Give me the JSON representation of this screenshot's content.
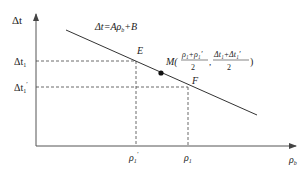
{
  "diagram": {
    "type": "line-graph",
    "axes": {
      "y_label": "Δt",
      "x_label": "ρ",
      "x_label_sub": "b"
    },
    "equation": {
      "text": "Δt=Aρ",
      "sub": "b",
      "suffix": "+B"
    },
    "points": {
      "E": {
        "label": "E"
      },
      "F": {
        "label": "F"
      },
      "M": {
        "label": "M(",
        "x_numerator": "ρ₁+ρ₁′",
        "x_denominator": "2",
        "separator": ",",
        "y_numerator": "Δt₁+Δt₁′",
        "y_denominator": "2",
        "close": ")"
      }
    },
    "ticks": {
      "y": [
        {
          "label": "Δt",
          "sub": "1",
          "prime": ""
        },
        {
          "label": "Δt",
          "sub": "1",
          "prime": "′"
        }
      ],
      "x": [
        {
          "label": "ρ",
          "sub": "1",
          "prime": "′"
        },
        {
          "label": "ρ",
          "sub": "1",
          "prime": ""
        }
      ]
    },
    "colors": {
      "line": "#333333",
      "axis": "#555555",
      "dashed": "#444444",
      "dot": "#111111"
    }
  }
}
